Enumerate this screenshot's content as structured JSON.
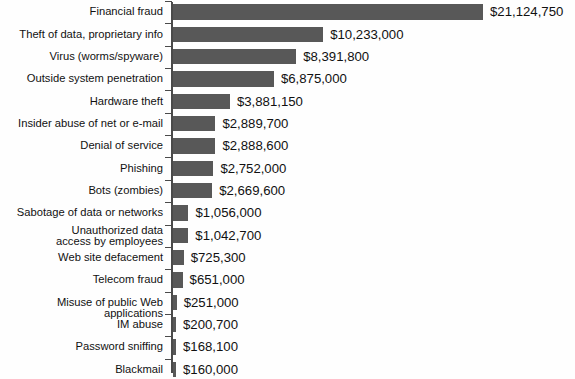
{
  "chart": {
    "title": "",
    "subtitle": "",
    "xlabel": "",
    "ylabel": "",
    "bar_color": "#585858",
    "axis_color": "#4a4a4a",
    "text_color": "#111111",
    "background": "#fefefe"
  },
  "chart_data": {
    "type": "bar",
    "orientation": "horizontal",
    "title": "",
    "xlabel": "",
    "ylabel": "",
    "grid": false,
    "legend": null,
    "xlim": [
      0,
      21124750
    ],
    "axis_visible": "category-axis-only",
    "value_labels_shown": true,
    "value_label_format": "$#,###",
    "categories": [
      "Financial fraud",
      "Theft of data, proprietary info",
      "Virus (worms/spyware)",
      "Outside system penetration",
      "Hardware theft",
      "Insider abuse of net or e-mail",
      "Denial of service",
      "Phishing",
      "Bots (zombies)",
      "Sabotage of data or networks",
      "Unauthorized data\naccess by employees",
      "Web site defacement",
      "Telecom fraud",
      "Misuse of public Web applications",
      "IM abuse",
      "Password sniffing",
      "Blackmail"
    ],
    "values": [
      21124750,
      10233000,
      8391800,
      6875000,
      3881150,
      2889700,
      2888600,
      2752000,
      2669600,
      1056000,
      1042700,
      725300,
      651000,
      251000,
      200700,
      168100,
      160000
    ],
    "value_labels": [
      "$21,124,750",
      "$10,233,000",
      "$8,391,800",
      "$6,875,000",
      "$3,881,150",
      "$2,889,700",
      "$2,888,600",
      "$2,752,000",
      "$2,669,600",
      "$1,056,000",
      "$1,042,700",
      "$725,300",
      "$651,000",
      "$251,000",
      "$200,700",
      "$168,100",
      "$160,000"
    ]
  }
}
